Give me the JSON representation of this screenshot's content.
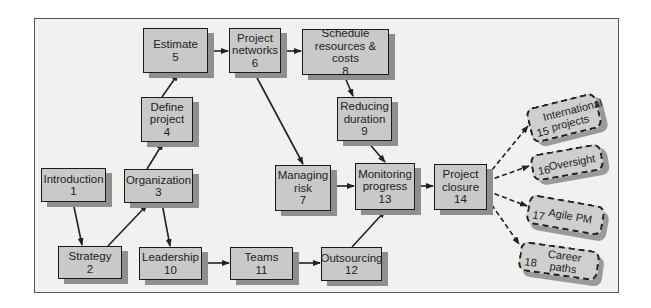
{
  "diagram": {
    "type": "flowchart",
    "nodes": [
      {
        "id": 1,
        "label": "Introduction",
        "number": "1"
      },
      {
        "id": 2,
        "label": "Strategy",
        "number": "2"
      },
      {
        "id": 3,
        "label": "Organization",
        "number": "3"
      },
      {
        "id": 4,
        "label_line1": "Define",
        "label_line2": "project",
        "number": "4"
      },
      {
        "id": 5,
        "label": "Estimate",
        "number": "5"
      },
      {
        "id": 6,
        "label_line1": "Project",
        "label_line2": "networks",
        "number": "6"
      },
      {
        "id": 7,
        "label_line1": "Managing",
        "label_line2": "risk",
        "number": "7"
      },
      {
        "id": 8,
        "label_line1": "Schedule",
        "label_line2": "resources & costs",
        "number": "8"
      },
      {
        "id": 9,
        "label_line1": "Reducing",
        "label_line2": "duration",
        "number": "9"
      },
      {
        "id": 10,
        "label": "Leadership",
        "number": "10"
      },
      {
        "id": 11,
        "label": "Teams",
        "number": "11"
      },
      {
        "id": 12,
        "label": "Outsourcing",
        "number": "12"
      },
      {
        "id": 13,
        "label_line1": "Monitoring",
        "label_line2": "progress",
        "number": "13"
      },
      {
        "id": 14,
        "label_line1": "Project",
        "label_line2": "closure",
        "number": "14"
      },
      {
        "id": 15,
        "label_line1": "International",
        "label_line2": "projects",
        "number": "15",
        "style": "dashed"
      },
      {
        "id": 16,
        "label": "Oversight",
        "number": "16",
        "style": "dashed"
      },
      {
        "id": 17,
        "label": "Agile PM",
        "number": "17",
        "style": "dashed"
      },
      {
        "id": 18,
        "label": "Career paths",
        "number": "18",
        "style": "dashed"
      }
    ],
    "edges": [
      {
        "from": 1,
        "to": 2
      },
      {
        "from": 2,
        "to": 3
      },
      {
        "from": 3,
        "to": 4
      },
      {
        "from": 4,
        "to": 5
      },
      {
        "from": 5,
        "to": 6
      },
      {
        "from": 6,
        "to": 8
      },
      {
        "from": 8,
        "to": 9
      },
      {
        "from": 6,
        "to": 7
      },
      {
        "from": 3,
        "to": 10
      },
      {
        "from": 10,
        "to": 11
      },
      {
        "from": 11,
        "to": 12
      },
      {
        "from": 12,
        "to": 13
      },
      {
        "from": 7,
        "to": 13
      },
      {
        "from": 9,
        "to": 13
      },
      {
        "from": 13,
        "to": 14
      },
      {
        "from": 14,
        "to": 15,
        "style": "dashed"
      },
      {
        "from": 14,
        "to": 16,
        "style": "dashed"
      },
      {
        "from": 14,
        "to": 17,
        "style": "dashed"
      },
      {
        "from": 14,
        "to": 18,
        "style": "dashed"
      }
    ]
  },
  "colors": {
    "node_fill": "#c9c9c9",
    "node_border": "#1a1a1a",
    "shadow": "#8f8f8f",
    "background": "#f1f1f0"
  }
}
